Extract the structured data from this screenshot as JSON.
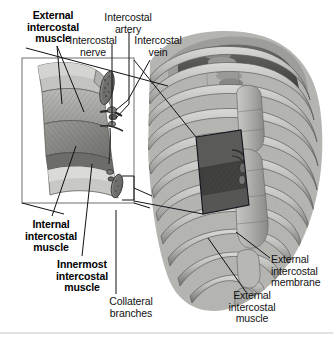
{
  "figure": {
    "background_color": "#ffffff",
    "line_color": "#1a1a1a",
    "footer_rule_color": "#e2e2e2"
  },
  "labels": {
    "external_intercostal_muscle_left": "External\nintercostal\nmuscle",
    "intercostal_nerve": "Intercostal\nnerve",
    "intercostal_artery": "Intercostal\nartery",
    "intercostal_vein": "Intercostal\nvein",
    "internal_intercostal_muscle": "Internal\nintercostal\nmuscle",
    "innermost_intercostal_muscle": "Innermost\nintercostal\nmuscle",
    "collateral_branches": "Collateral\nbranches",
    "external_intercostal_membrane": "External\nintercostal\nmembrane",
    "external_intercostal_muscle_right": "External\nintercostal\nmuscle"
  },
  "label_styles": {
    "external_intercostal_muscle_left": "bold",
    "intercostal_nerve": "regular",
    "intercostal_artery": "regular",
    "intercostal_vein": "regular",
    "internal_intercostal_muscle": "bold",
    "innermost_intercostal_muscle": "bold",
    "collateral_branches": "regular",
    "external_intercostal_membrane": "regular",
    "external_intercostal_muscle_right": "regular"
  },
  "anatomy_parts": [
    "rib",
    "sternum",
    "costal cartilage",
    "thoracic vertebra",
    "external intercostal muscle",
    "internal intercostal muscle",
    "innermost intercostal muscle",
    "external intercostal membrane",
    "intercostal nerve",
    "intercostal artery",
    "intercostal vein",
    "collateral branches",
    "xiphoid process"
  ],
  "inset": {
    "type": "magnified-callout",
    "location": "left side of figure",
    "source_region": "lateral intercostal space on rib cage"
  }
}
